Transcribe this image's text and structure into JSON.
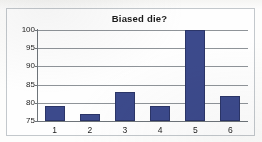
{
  "chart_data": {
    "type": "bar",
    "title": "Biased die?",
    "xlabel": "",
    "ylabel": "",
    "categories": [
      "1",
      "2",
      "3",
      "4",
      "5",
      "6"
    ],
    "values": [
      79,
      77,
      83,
      79,
      100,
      82
    ],
    "ylim": [
      75,
      100
    ],
    "yticks": [
      75,
      80,
      85,
      90,
      95,
      100
    ],
    "ytick_labels": [
      "75",
      "80",
      "85",
      "90",
      "95",
      "100"
    ],
    "grid": true,
    "grid_axis": "y",
    "legend": false,
    "legend_position": "none",
    "series": [
      {
        "name": "Frequency",
        "values": [
          79,
          77,
          83,
          79,
          100,
          82
        ]
      }
    ],
    "colors": {
      "bar_fill": "#3c4a8c",
      "bar_stroke": "#2b3568",
      "gridline": "#8f9499",
      "axis": "#6e7479",
      "frame": "#c3c8cc",
      "plot_background": "#fefefe",
      "text": "#1d1d1d"
    }
  }
}
